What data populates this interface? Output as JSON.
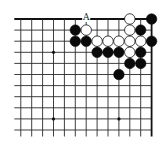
{
  "diagram": {
    "type": "go-board-diagram",
    "view": "top-right corner fragment",
    "grid": {
      "columns": 13,
      "rows": 11,
      "origin_x": 20.8,
      "origin_y": 19,
      "spacing_x": 10.9,
      "spacing_y": 11.1,
      "left_extend": 6.5,
      "bottom_extend": 6.5,
      "edges": [
        "top",
        "right"
      ]
    },
    "colors": {
      "line": "#2a2a2a",
      "black_stone": "#0a0a0a",
      "white_stone": "#ffffff",
      "background": "#ffffff"
    },
    "star_points": [
      {
        "col": 3,
        "row": 3
      },
      {
        "col": 3,
        "row": 9
      },
      {
        "col": 9,
        "row": 9
      }
    ],
    "stones": [
      {
        "col": 10,
        "row": 0,
        "color": "white"
      },
      {
        "col": 12,
        "row": 0,
        "color": "black"
      },
      {
        "col": 5,
        "row": 1,
        "color": "black"
      },
      {
        "col": 6,
        "row": 1,
        "color": "white"
      },
      {
        "col": 10,
        "row": 1,
        "color": "white"
      },
      {
        "col": 11,
        "row": 1,
        "color": "black"
      },
      {
        "col": 5,
        "row": 2,
        "color": "black"
      },
      {
        "col": 6,
        "row": 2,
        "color": "black"
      },
      {
        "col": 7,
        "row": 2,
        "color": "white"
      },
      {
        "col": 8,
        "row": 2,
        "color": "white"
      },
      {
        "col": 9,
        "row": 2,
        "color": "white"
      },
      {
        "col": 10,
        "row": 2,
        "color": "white"
      },
      {
        "col": 11,
        "row": 2,
        "color": "white"
      },
      {
        "col": 12,
        "row": 2,
        "color": "black"
      },
      {
        "col": 7,
        "row": 3,
        "color": "black"
      },
      {
        "col": 8,
        "row": 3,
        "color": "black"
      },
      {
        "col": 9,
        "row": 3,
        "color": "black"
      },
      {
        "col": 10,
        "row": 3,
        "color": "white"
      },
      {
        "col": 11,
        "row": 3,
        "color": "black"
      },
      {
        "col": 10,
        "row": 4,
        "color": "black"
      },
      {
        "col": 11,
        "row": 4,
        "color": "black"
      },
      {
        "col": 9,
        "row": 5,
        "color": "black"
      }
    ],
    "labels": [
      {
        "col": 6,
        "row": 0,
        "text": "A"
      }
    ]
  }
}
